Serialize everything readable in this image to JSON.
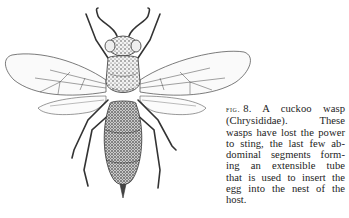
{
  "figure": {
    "ink_color": "#222222",
    "paper_color": "#ffffff"
  },
  "caption": {
    "fig_label": "fig.",
    "fig_number": "8.",
    "lines": [
      "A cuckoo wasp",
      "(Chrysididae). These",
      "wasps have lost the power",
      "to sting, the last few ab-",
      "dominal segments form-",
      "ing an extensible tube",
      "that is used to insert the",
      "egg into the nest of the",
      "host."
    ]
  }
}
